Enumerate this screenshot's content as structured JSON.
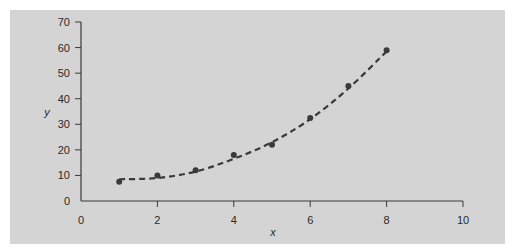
{
  "chart_data": {
    "type": "scatter",
    "title": "",
    "xlabel": "x",
    "ylabel": "y",
    "xlim": [
      0,
      10
    ],
    "ylim": [
      0,
      70
    ],
    "xticks": [
      0,
      2,
      4,
      6,
      8,
      10
    ],
    "yticks": [
      0,
      10,
      20,
      30,
      40,
      50,
      60,
      70
    ],
    "grid": false,
    "legend": null,
    "series": [
      {
        "name": "observed",
        "style": "points",
        "x": [
          1,
          2,
          3,
          4,
          5,
          6,
          7,
          8
        ],
        "y": [
          7.5,
          10,
          12,
          18,
          22,
          32.5,
          45,
          59
        ]
      },
      {
        "name": "fitted curve",
        "style": "dashed-line",
        "x": [
          1,
          2,
          3,
          4,
          5,
          6,
          7,
          8
        ],
        "y": [
          8.5,
          9,
          11.5,
          16.5,
          23,
          32,
          44,
          58.5
        ]
      }
    ],
    "colors": {
      "panel": "#d4d4d4",
      "ink": "#3a3a3a"
    }
  }
}
